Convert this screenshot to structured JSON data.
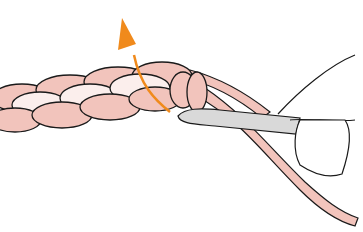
{
  "illustration": {
    "subject": "crochet chain stitch with hook",
    "alt": "Crochet hook pulling yarn through a loop on a chain, arrow indicating upward pull",
    "colors": {
      "background": "#ffffff",
      "yarn_dark": "#f2c4bc",
      "yarn_light": "#fbeeec",
      "outline": "#1a1a1a",
      "hook": "#d9d9d9",
      "arrow": "#f08a1c"
    },
    "elements": [
      "yarn-chain",
      "crochet-hook",
      "hand-thumb",
      "working-yarn",
      "direction-arrow"
    ]
  }
}
